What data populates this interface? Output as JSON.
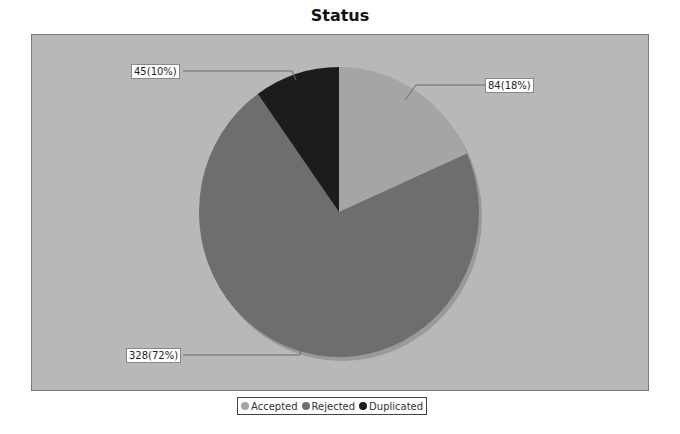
{
  "chart_data": {
    "type": "pie",
    "title": "Status",
    "categories": [
      "Accepted",
      "Rejected",
      "Duplicated"
    ],
    "values": [
      84,
      328,
      45
    ],
    "percentages": [
      18,
      72,
      10
    ],
    "colors": [
      "#a5a5a5",
      "#6e6e6e",
      "#1c1c1c"
    ],
    "labels": [
      "84(18%)",
      "328(72%)",
      "45(10%)"
    ],
    "legend_position": "bottom",
    "start_angle": "12 o'clock, clockwise"
  },
  "title": "Status",
  "labels": {
    "accepted": "84(18%)",
    "rejected": "328(72%)",
    "duplicated": "45(10%)"
  },
  "legend": {
    "items": [
      {
        "label": "Accepted",
        "color": "#a5a5a5"
      },
      {
        "label": "Rejected",
        "color": "#6e6e6e"
      },
      {
        "label": "Duplicated",
        "color": "#1c1c1c"
      }
    ]
  }
}
